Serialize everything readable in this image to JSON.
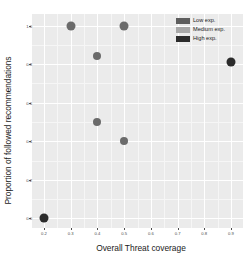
{
  "chart_data": {
    "type": "scatter",
    "title": "",
    "xlabel": "Overall Threat coverage",
    "ylabel": "Proportion of followed recommendations",
    "xlim": [
      0.155,
      0.945
    ],
    "ylim": [
      -0.05,
      1.06
    ],
    "xticks": [
      0.2,
      0.3,
      0.4,
      0.5,
      0.6,
      0.7,
      0.8,
      0.9
    ],
    "xticklabels": [
      "0.2",
      "0.3",
      "0.4",
      "0.5",
      "0.6",
      "0.7",
      "0.8",
      "0.9"
    ],
    "yticks": [
      0.0,
      0.2,
      0.4,
      0.6,
      0.8,
      1.0
    ],
    "yticklabels": [
      "0.0",
      "0.2",
      "0.4",
      "0.6",
      "0.8",
      "1.0"
    ],
    "grid": true,
    "grid_color": "#ffffff",
    "panel_background": "#ebebeb",
    "legend_position": "top-right",
    "legend_title": "",
    "series": [
      {
        "name": "Low exp.",
        "color": "#5e5e5e",
        "points": []
      },
      {
        "name": "Medium exp.",
        "color": "#a8a8a8",
        "points": []
      },
      {
        "name": "High exp.",
        "color": "#2b2b2b",
        "points": []
      }
    ],
    "points": [
      {
        "x": 0.2,
        "y": 0.0,
        "group": "High exp.",
        "color": "#2b2b2b",
        "size": 9
      },
      {
        "x": 0.3,
        "y": 1.0,
        "group": "Low exp.",
        "color": "#6b6b6b",
        "size": 9
      },
      {
        "x": 0.4,
        "y": 0.84,
        "group": "Low exp.",
        "color": "#6b6b6b",
        "size": 8
      },
      {
        "x": 0.4,
        "y": 0.5,
        "group": "Low exp.",
        "color": "#6b6b6b",
        "size": 8
      },
      {
        "x": 0.5,
        "y": 1.0,
        "group": "Low exp.",
        "color": "#6b6b6b",
        "size": 9
      },
      {
        "x": 0.5,
        "y": 0.4,
        "group": "Low exp.",
        "color": "#6b6b6b",
        "size": 8
      },
      {
        "x": 0.9,
        "y": 0.81,
        "group": "High exp.",
        "color": "#2b2b2b",
        "size": 9
      }
    ]
  },
  "legend": {
    "items": [
      {
        "label": "Low exp.",
        "color": "#5e5e5e"
      },
      {
        "label": "Medium exp.",
        "color": "#a8a8a8"
      },
      {
        "label": "High exp.",
        "color": "#2b2b2b"
      }
    ]
  },
  "axes": {
    "x_title": "Overall Threat coverage",
    "y_title": "Proportion of followed recommendations"
  }
}
